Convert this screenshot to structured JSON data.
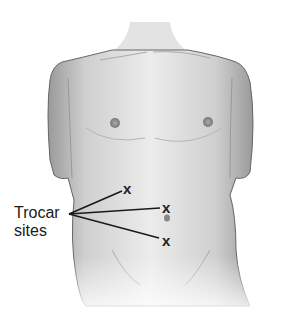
{
  "figure": {
    "label_line1": "Trocar",
    "label_line2": "sites",
    "marks": [
      {
        "symbol": "x",
        "x": 128,
        "y": 188
      },
      {
        "symbol": "x",
        "x": 167,
        "y": 207
      },
      {
        "symbol": "x",
        "x": 167,
        "y": 240
      }
    ],
    "colors": {
      "skin_light": "#e6e6e6",
      "skin_shadow": "#9a9a9a",
      "outline": "#555555",
      "text": "#1a1a1a",
      "background": "#ffffff"
    }
  }
}
